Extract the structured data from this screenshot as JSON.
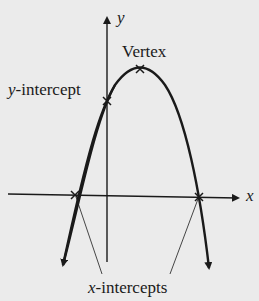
{
  "diagram": {
    "axes": {
      "x_label": "x",
      "y_label": "y"
    },
    "labels": {
      "vertex": "Vertex",
      "y_intercept_var": "y",
      "y_intercept_rest": "-intercept",
      "x_intercepts_var": "x",
      "x_intercepts_rest": "-intercepts"
    },
    "colors": {
      "background": "#ebebeb",
      "ink": "#1a1a1a"
    }
  }
}
